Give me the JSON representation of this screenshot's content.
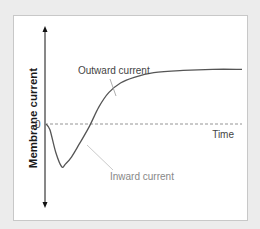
{
  "chart_data": {
    "type": "line",
    "title": "",
    "ylabel": "Membrane current",
    "xlabel": "Time",
    "zero_label": "0",
    "series": [
      {
        "name": "Membrane current",
        "color": "#555555",
        "x": [
          0,
          0.02,
          0.05,
          0.08,
          0.1,
          0.13,
          0.17,
          0.22,
          0.27,
          0.32,
          0.38,
          0.45,
          0.55,
          0.7,
          0.85,
          1.0
        ],
        "y": [
          0,
          -0.1,
          -0.5,
          -0.75,
          -0.7,
          -0.58,
          -0.35,
          -0.05,
          0.3,
          0.55,
          0.72,
          0.82,
          0.9,
          0.94,
          0.96,
          0.96
        ]
      }
    ],
    "xlim": [
      0,
      1
    ],
    "ylim": [
      -1.35,
      1.65
    ],
    "zero_line": {
      "style": "dashed",
      "color": "#888888"
    },
    "annotations": [
      {
        "text": "Outward current",
        "color": "#444444",
        "target_series_x": 0.38
      },
      {
        "text": "Inward current",
        "color": "#888888",
        "target_series_x": 0.22
      }
    ],
    "grid": false
  }
}
